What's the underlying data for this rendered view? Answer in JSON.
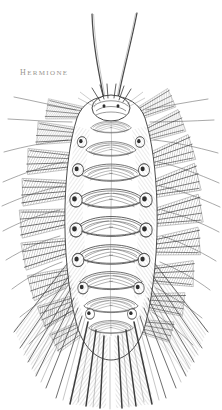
{
  "plate": {
    "kind": "natural-history-engraving",
    "subject_label": "Hermione",
    "orientation": "dorsal view",
    "background_color": "#ffffff",
    "ink_color": "#2b2b2b",
    "label_color": "#9a968f",
    "label_position": "upper-left",
    "canvas": {
      "width": 222,
      "height": 410
    }
  },
  "specimen": {
    "common_name": "sea mouse",
    "body_plan": "elongate oval, bilaterally symmetric, segmented",
    "segment_count": 9,
    "antennae_count": 2,
    "antennae_description": "two long slender antennae curving upward and outward from the head",
    "elytra_description": "overlapping dorsal scales arranged as stacked arcs along the midline",
    "chaetae_description": "dense radiating bristle bundles along both flanks and fanning at the posterior",
    "axis_x": 111,
    "head_y": 98,
    "tail_y": 400
  },
  "anatomy_parts": [
    {
      "name": "antenna-left",
      "label": "left antenna"
    },
    {
      "name": "antenna-right",
      "label": "right antenna"
    },
    {
      "name": "head",
      "label": "prostomium"
    },
    {
      "name": "elytra-column",
      "label": "dorsal elytra"
    },
    {
      "name": "chaetae-left",
      "label": "left notochaetae"
    },
    {
      "name": "chaetae-right",
      "label": "right notochaetae"
    },
    {
      "name": "tail-fan",
      "label": "posterior chaetal fan"
    }
  ]
}
